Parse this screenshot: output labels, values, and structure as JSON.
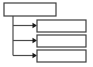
{
  "diagram": {
    "type": "flowchart",
    "background_color": "#ffffff",
    "node_fill_color": "#ffffff",
    "node_stroke_color": "#3c3c3c",
    "connector_color": "#4a4a4a",
    "arrow_color": "#1a1a1a",
    "parent_node": {
      "label": ""
    },
    "child_nodes": [
      {
        "label": ""
      },
      {
        "label": ""
      },
      {
        "label": ""
      }
    ]
  }
}
